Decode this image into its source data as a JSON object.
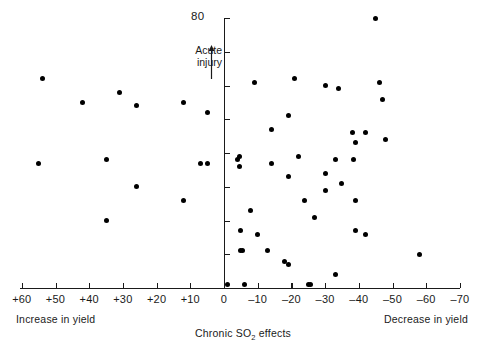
{
  "chart_data": {
    "type": "scatter",
    "title": "",
    "xlabel": "Chronic SO₂ effects",
    "ylabel": "Acute injury",
    "xlim": [
      60,
      -70
    ],
    "ylim": [
      0,
      80
    ],
    "x_ticks": [
      "+60",
      "+50",
      "+40",
      "+30",
      "+20",
      "+10",
      "0",
      "–10",
      "–20",
      "–30",
      "–40",
      "–50",
      "–60",
      "–70"
    ],
    "x_tick_values": [
      60,
      50,
      40,
      30,
      20,
      10,
      0,
      -10,
      -20,
      -30,
      -40,
      -50,
      -60,
      -70
    ],
    "y_ticks": [
      "80"
    ],
    "y_tick_values": [
      80,
      70,
      60,
      50,
      40,
      30,
      20,
      10,
      0
    ],
    "y_axis_top_label": "80",
    "grid": false,
    "legend": null,
    "annotations": {
      "acute_injury": "Acute\ninjury",
      "acute_injury_line1": "Acute",
      "acute_injury_line2": "injury",
      "acute_arrow_direction": "up",
      "left_caption": "Increase in yield",
      "right_caption": "Decrease in yield"
    },
    "points": [
      {
        "x": 54,
        "y": 62
      },
      {
        "x": 42,
        "y": 55
      },
      {
        "x": 35,
        "y": 38
      },
      {
        "x": 35,
        "y": 20
      },
      {
        "x": 31,
        "y": 58
      },
      {
        "x": 26,
        "y": 54
      },
      {
        "x": 26,
        "y": 30
      },
      {
        "x": 55,
        "y": 37
      },
      {
        "x": 12,
        "y": 55
      },
      {
        "x": 12,
        "y": 26
      },
      {
        "x": 7,
        "y": 37
      },
      {
        "x": 5,
        "y": 37
      },
      {
        "x": 5,
        "y": 52
      },
      {
        "x": -1,
        "y": 1
      },
      {
        "x": -4,
        "y": 38
      },
      {
        "x": -4.5,
        "y": 39
      },
      {
        "x": -4.5,
        "y": 36
      },
      {
        "x": -5,
        "y": 17
      },
      {
        "x": -5,
        "y": 11
      },
      {
        "x": -5.6,
        "y": 11
      },
      {
        "x": -6,
        "y": 1
      },
      {
        "x": -8,
        "y": 23
      },
      {
        "x": -9,
        "y": 61
      },
      {
        "x": -10,
        "y": 16
      },
      {
        "x": -13,
        "y": 11
      },
      {
        "x": -14,
        "y": 47
      },
      {
        "x": -14,
        "y": 37
      },
      {
        "x": -18,
        "y": 8
      },
      {
        "x": -19,
        "y": 7
      },
      {
        "x": -19,
        "y": 51
      },
      {
        "x": -19,
        "y": 33
      },
      {
        "x": -21,
        "y": 62
      },
      {
        "x": -22,
        "y": 39
      },
      {
        "x": -24,
        "y": 26
      },
      {
        "x": -25,
        "y": 1
      },
      {
        "x": -25.8,
        "y": 1
      },
      {
        "x": -27,
        "y": 21
      },
      {
        "x": -30,
        "y": 60
      },
      {
        "x": -30,
        "y": 34
      },
      {
        "x": -30,
        "y": 29
      },
      {
        "x": -33,
        "y": 38
      },
      {
        "x": -33,
        "y": 4
      },
      {
        "x": -34,
        "y": 59
      },
      {
        "x": -35,
        "y": 31
      },
      {
        "x": -38,
        "y": 46
      },
      {
        "x": -38.5,
        "y": 38
      },
      {
        "x": -39,
        "y": 43
      },
      {
        "x": -39,
        "y": 26
      },
      {
        "x": -39,
        "y": 17
      },
      {
        "x": -42,
        "y": 46
      },
      {
        "x": -42,
        "y": 16
      },
      {
        "x": -45,
        "y": 80
      },
      {
        "x": -46,
        "y": 61
      },
      {
        "x": -47,
        "y": 56
      },
      {
        "x": -48,
        "y": 44
      },
      {
        "x": -58,
        "y": 10
      }
    ]
  }
}
